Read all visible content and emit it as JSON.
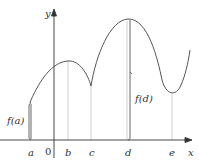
{
  "diagram": {
    "type": "function-graph",
    "axes": {
      "x_label": "x",
      "y_label": "y",
      "origin_label": "0"
    },
    "points": [
      {
        "label": "a",
        "x": 30
      },
      {
        "label": "b",
        "x": 68
      },
      {
        "label": "c",
        "x": 91
      },
      {
        "label": "d",
        "x": 130
      },
      {
        "label": "e",
        "x": 172
      }
    ],
    "braces": [
      {
        "label": "f(a)",
        "at": "a"
      },
      {
        "label": "f(d)",
        "at": "d"
      }
    ],
    "colors": {
      "curve": "#555555",
      "axis": "#333333",
      "guide": "#bbbbbb",
      "text": "#333333"
    }
  }
}
